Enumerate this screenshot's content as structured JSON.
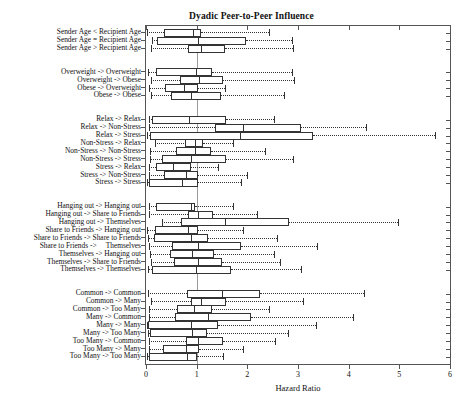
{
  "chart_data": {
    "type": "box",
    "title": "Dyadic Peer-to-Peer Influence",
    "xlabel": "Hazard Ratio",
    "ylabel": "",
    "xlim": [
      0,
      6
    ],
    "xticks": [
      0,
      1,
      2,
      3,
      4,
      5,
      6
    ],
    "xticklabels": [
      "0",
      "1",
      "2",
      "3",
      "4",
      "5",
      "6"
    ],
    "grid": false,
    "reference_line": 1,
    "orientation": "horizontal",
    "legend": null,
    "groups": [
      {
        "name": "Age",
        "boxes": [
          {
            "label": "Sender Age < Recipient Age",
            "whisker_low": 0.02,
            "q1": 0.36,
            "median": 0.92,
            "q3": 1.08,
            "whisker_high": 2.42
          },
          {
            "label": "Sender Age = Recipient Age",
            "whisker_low": 0.12,
            "q1": 0.22,
            "median": 1.02,
            "q3": 1.97,
            "whisker_high": 2.88
          },
          {
            "label": "Sender Age > Recipient Age",
            "whisker_low": 0.1,
            "q1": 0.82,
            "median": 1.08,
            "q3": 1.55,
            "whisker_high": 2.9
          }
        ]
      },
      {
        "name": "Weight",
        "boxes": [
          {
            "label": "Overweight -> Overweight",
            "whisker_low": 0.03,
            "q1": 0.2,
            "median": 0.98,
            "q3": 1.3,
            "whisker_high": 2.88
          },
          {
            "label": "Overweight -> Obese",
            "whisker_low": 0.1,
            "q1": 0.67,
            "median": 1.05,
            "q3": 1.52,
            "whisker_high": 2.92
          },
          {
            "label": "Obese -> Overweight",
            "whisker_low": 0.05,
            "q1": 0.38,
            "median": 0.75,
            "q3": 1.02,
            "whisker_high": 1.55
          },
          {
            "label": "Obese -> Obese",
            "whisker_low": 0.1,
            "q1": 0.5,
            "median": 0.88,
            "q3": 1.48,
            "whisker_high": 2.72
          }
        ]
      },
      {
        "name": "Stress",
        "boxes": [
          {
            "label": "Relax -> Relax",
            "whisker_low": 0.06,
            "q1": 0.12,
            "median": 0.85,
            "q3": 1.58,
            "whisker_high": 2.52
          },
          {
            "label": "Relax -> Non-Stress",
            "whisker_low": 0.06,
            "q1": 1.36,
            "median": 1.92,
            "q3": 3.05,
            "whisker_high": 4.35
          },
          {
            "label": "Relax -> Stress",
            "whisker_low": 0.02,
            "q1": 0.08,
            "median": 1.86,
            "q3": 3.3,
            "whisker_high": 5.7
          },
          {
            "label": "Non-Stress -> Relax",
            "whisker_low": 0.18,
            "q1": 0.76,
            "median": 0.97,
            "q3": 1.12,
            "whisker_high": 1.72
          },
          {
            "label": "Non-Stress -> Non-Stress",
            "whisker_low": 0.08,
            "q1": 0.6,
            "median": 0.96,
            "q3": 1.28,
            "whisker_high": 2.35
          },
          {
            "label": "Non-Stress -> Stress",
            "whisker_low": 0.08,
            "q1": 0.32,
            "median": 0.88,
            "q3": 1.58,
            "whisker_high": 2.9
          },
          {
            "label": "Stress -> Relax",
            "whisker_low": 0.05,
            "q1": 0.19,
            "median": 0.53,
            "q3": 0.88,
            "whisker_high": 1.42
          },
          {
            "label": "Stress -> Non-Stress",
            "whisker_low": 0.05,
            "q1": 0.35,
            "median": 0.78,
            "q3": 1.02,
            "whisker_high": 2.0
          },
          {
            "label": "Stress -> Stress",
            "whisker_low": 0.02,
            "q1": 0.05,
            "median": 0.72,
            "q3": 1.02,
            "whisker_high": 1.88
          }
        ]
      },
      {
        "name": "Activity",
        "boxes": [
          {
            "label": "Hanging out -> Hanging out",
            "whisker_low": 0.05,
            "q1": 0.2,
            "median": 0.88,
            "q3": 0.97,
            "whisker_high": 1.72
          },
          {
            "label": "Hanging out -> Share to Friends",
            "whisker_low": 0.06,
            "q1": 0.82,
            "median": 1.02,
            "q3": 1.32,
            "whisker_high": 2.2
          },
          {
            "label": "Hanging out -> Themselves",
            "whisker_low": 0.32,
            "q1": 0.7,
            "median": 1.55,
            "q3": 2.82,
            "whisker_high": 4.98
          },
          {
            "label": "Share to Friends -> Hanging out",
            "whisker_low": 0.02,
            "q1": 0.18,
            "median": 0.82,
            "q3": 1.02,
            "whisker_high": 1.92
          },
          {
            "label": "Share to Friends -> Share to Friends",
            "whisker_low": 0.03,
            "q1": 0.16,
            "median": 0.88,
            "q3": 1.22,
            "whisker_high": 2.58
          },
          {
            "label": "Share to Friends ->     Themselves",
            "whisker_low": 0.05,
            "q1": 0.52,
            "median": 1.02,
            "q3": 1.88,
            "whisker_high": 3.38
          },
          {
            "label": "Themselves -> Hanging out",
            "whisker_low": 0.08,
            "q1": 0.48,
            "median": 0.9,
            "q3": 1.35,
            "whisker_high": 2.52
          },
          {
            "label": "Themselves -> Share to Friends",
            "whisker_low": 0.1,
            "q1": 0.55,
            "median": 1.02,
            "q3": 1.5,
            "whisker_high": 2.65
          },
          {
            "label": "Themselves -> Themselves",
            "whisker_low": 0.03,
            "q1": 0.12,
            "median": 0.98,
            "q3": 1.68,
            "whisker_high": 3.05
          }
        ]
      },
      {
        "name": "Friends",
        "boxes": [
          {
            "label": "Common -> Common",
            "whisker_low": 0.04,
            "q1": 0.8,
            "median": 1.5,
            "q3": 2.25,
            "whisker_high": 4.3
          },
          {
            "label": "Common -> Many",
            "whisker_low": 0.1,
            "q1": 0.88,
            "median": 1.08,
            "q3": 1.58,
            "whisker_high": 3.1
          },
          {
            "label": "Common -> Too Many",
            "whisker_low": 0.05,
            "q1": 0.62,
            "median": 0.95,
            "q3": 1.3,
            "whisker_high": 2.42
          },
          {
            "label": "Many -> Common",
            "whisker_low": 0.05,
            "q1": 0.58,
            "median": 1.22,
            "q3": 2.08,
            "whisker_high": 4.08
          },
          {
            "label": "Many -> Many",
            "whisker_low": 0.02,
            "q1": 0.04,
            "median": 0.88,
            "q3": 1.42,
            "whisker_high": 3.35
          },
          {
            "label": "Many -> Too Many",
            "whisker_low": 0.03,
            "q1": 0.08,
            "median": 0.9,
            "q3": 1.2,
            "whisker_high": 2.8
          },
          {
            "label": "Too Many -> Common",
            "whisker_low": 0.05,
            "q1": 0.78,
            "median": 1.02,
            "q3": 1.52,
            "whisker_high": 2.55
          },
          {
            "label": "Too Many -> Many",
            "whisker_low": 0.05,
            "q1": 0.33,
            "median": 0.78,
            "q3": 1.05,
            "whisker_high": 1.92
          },
          {
            "label": "Too Many -> Too Many",
            "whisker_low": 0.02,
            "q1": 0.05,
            "median": 0.8,
            "q3": 1.0,
            "whisker_high": 1.52
          }
        ]
      }
    ]
  }
}
